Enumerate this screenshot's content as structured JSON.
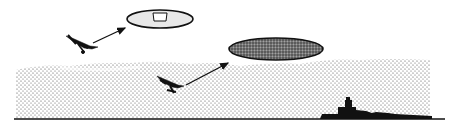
{
  "diagram": {
    "colors": {
      "background": "#ffffff",
      "ink": "#111111",
      "fog_dot": "#444444",
      "clear_view_fill": "#e6e6e6",
      "obscured_view_fill": "#6a6a6a"
    },
    "elements": [
      {
        "id": "clear-view-ellipse",
        "cx": 160,
        "cy": 19,
        "rx": 33,
        "ry": 9
      },
      {
        "id": "obscured-view-ellipse",
        "cx": 276,
        "cy": 49,
        "rx": 47,
        "ry": 11
      },
      {
        "id": "upper-aircraft",
        "x": 80,
        "y": 42
      },
      {
        "id": "lower-aircraft",
        "x": 175,
        "y": 88
      },
      {
        "id": "fog-layer",
        "x_from": 14,
        "x_to": 430,
        "y_top": 62,
        "y_bottom": 118
      },
      {
        "id": "ship-silhouette",
        "x": 330,
        "y": 95
      },
      {
        "id": "horizon-line",
        "y": 119,
        "x_from": 14,
        "x_to": 445
      }
    ]
  }
}
